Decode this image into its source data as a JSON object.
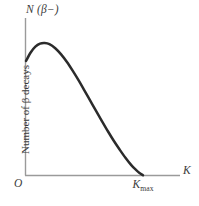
{
  "figure": {
    "background_color": "#ffffff",
    "axis_color": "#9a9a9a",
    "curve_color": "#2b2b2b",
    "text_color": "#3b3b3b"
  },
  "labels": {
    "y_axis_symbol_main": "N",
    "y_axis_symbol_arg": "(β−)",
    "y_axis_title": "Number of β decays",
    "origin": "O",
    "x_axis_tick": "K",
    "x_axis_tick_sub": "max",
    "x_axis_symbol": "K"
  },
  "chart_data": {
    "type": "line",
    "title": "",
    "subtitle": "",
    "xlabel": "K",
    "ylabel": "Number of β decays",
    "ylabel_symbol": "N (β−)",
    "grid": false,
    "legend": "none",
    "xlim": [
      0,
      1.28
    ],
    "ylim": [
      0,
      1.0
    ],
    "xticks": [
      0,
      1.0
    ],
    "xticklabels": [
      "O",
      "Kmax"
    ],
    "yticks": [],
    "yticklabels": [],
    "annotations": [
      {
        "text": "Kmax",
        "x": 1.0,
        "y": 0.0,
        "note": "endpoint energy where spectrum goes to zero"
      }
    ],
    "series": [
      {
        "name": "beta-minus decay spectrum",
        "x": [
          0.0,
          0.04,
          0.08,
          0.12,
          0.16,
          0.2,
          0.25,
          0.3,
          0.35,
          0.4,
          0.45,
          0.5,
          0.55,
          0.6,
          0.65,
          0.7,
          0.75,
          0.8,
          0.85,
          0.9,
          0.94,
          0.97,
          1.0
        ],
        "y": [
          0.745,
          0.8,
          0.838,
          0.858,
          0.862,
          0.855,
          0.828,
          0.788,
          0.738,
          0.68,
          0.618,
          0.552,
          0.485,
          0.418,
          0.352,
          0.287,
          0.225,
          0.168,
          0.114,
          0.066,
          0.035,
          0.015,
          0.0
        ]
      }
    ]
  }
}
